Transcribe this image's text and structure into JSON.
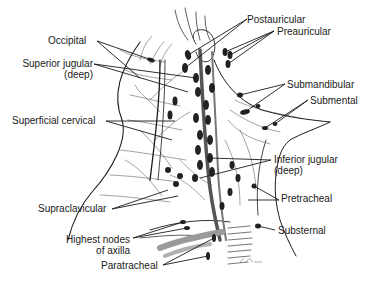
{
  "diagram": {
    "type": "anatomical illustration",
    "labels": {
      "postauricular": "Postauricular",
      "preauricular": "Preauricular",
      "occipital": "Occipital",
      "superior_jugular_line1": "Superior jugular",
      "superior_jugular_line2": "(deep)",
      "submandibular": "Submandibular",
      "submental": "Submental",
      "superficial_cervical": "Superficial cervical",
      "inferior_jugular_line1": "Inferior jugular",
      "inferior_jugular_line2": "(deep)",
      "pretracheal": "Pretracheal",
      "supraclavicular": "Supraclavicular",
      "substernal": "Substernal",
      "highest_nodes_line1": "Highest nodes",
      "highest_nodes_line2": "of axilla",
      "paratracheal": "Paratracheal"
    },
    "colors": {
      "ink": "#1a1a1a",
      "node_fill": "#222222",
      "vessel_shade": "#9a9a9a",
      "background": "#ffffff"
    }
  }
}
